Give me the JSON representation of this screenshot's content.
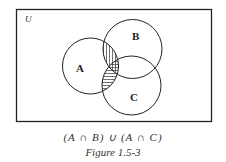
{
  "diagram": {
    "universe_label": "U",
    "sets": [
      {
        "name": "A",
        "cx": 90.5,
        "cy": 66,
        "r": 28
      },
      {
        "name": "B",
        "cx": 132.5,
        "cy": 49,
        "r": 29.5
      },
      {
        "name": "C",
        "cx": 131.5,
        "cy": 85.5,
        "r": 29.5
      }
    ],
    "shaded_regions": [
      {
        "region": "A ∩ B",
        "hatch": "vertical"
      },
      {
        "region": "A ∩ C",
        "hatch": "horizontal"
      }
    ],
    "expression": "(A ∩ B) ∪ (A ∩ C)",
    "caption": "Figure 1.5-3",
    "stroke_color": "#222222",
    "background_color": "#ffffff"
  }
}
